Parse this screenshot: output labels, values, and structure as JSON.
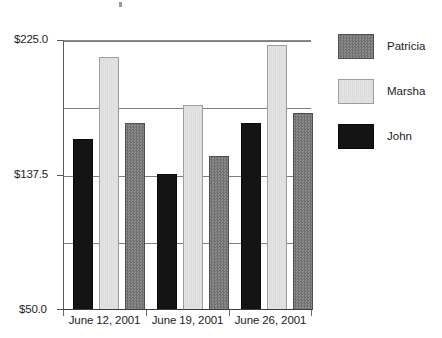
{
  "chart_data": {
    "type": "bar",
    "title": "",
    "subtitle": "",
    "xlabel": "",
    "ylabel": "",
    "categories": [
      "June 12, 2001",
      "June 19, 2001",
      "June 26, 2001"
    ],
    "series": [
      {
        "name": "Patricia",
        "color": "#7d7d7d",
        "values": [
          171.0,
          150.0,
          178.0
        ]
      },
      {
        "name": "Marsha",
        "color": "#dedede",
        "values": [
          214.0,
          183.0,
          222.0
        ]
      },
      {
        "name": "John",
        "color": "#141414",
        "values": [
          161.0,
          138.0,
          171.0
        ]
      }
    ],
    "bar_order_in_group": [
      "John",
      "Marsha",
      "Patricia"
    ],
    "ylim": [
      50.0,
      225.0
    ],
    "yticks": [
      50.0,
      93.75,
      137.5,
      181.25,
      225.0
    ],
    "ytick_labels_shown": [
      "$50.0",
      "$137.5",
      "$225.0"
    ],
    "grid": true,
    "gridlines_count": 5,
    "legend_position": "right",
    "currency_prefix": "$"
  },
  "axis": {
    "y_top_label": "$225.0",
    "y_mid_label": "$137.5",
    "y_bottom_label": "$50.0"
  },
  "legend": {
    "items": [
      {
        "label": "Patricia",
        "swatch": "patricia-swatch"
      },
      {
        "label": "Marsha",
        "swatch": "marsha-swatch"
      },
      {
        "label": "John",
        "swatch": "john-swatch"
      }
    ]
  }
}
